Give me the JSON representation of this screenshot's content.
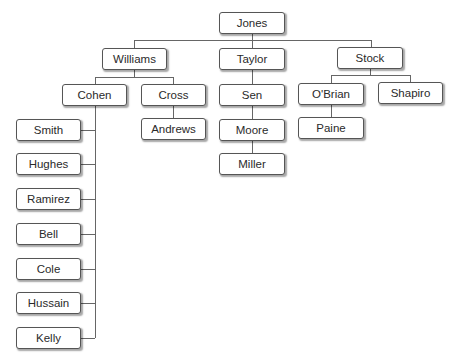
{
  "diagram": {
    "type": "org-chart",
    "nodes": {
      "jones": {
        "label": "Jones",
        "x": 219,
        "y": 12,
        "w": 66,
        "h": 22
      },
      "williams": {
        "label": "Williams",
        "x": 102,
        "y": 48,
        "w": 65,
        "h": 22
      },
      "taylor": {
        "label": "Taylor",
        "x": 219,
        "y": 48,
        "w": 66,
        "h": 22
      },
      "stock": {
        "label": "Stock",
        "x": 337,
        "y": 47,
        "w": 66,
        "h": 22
      },
      "cohen": {
        "label": "Cohen",
        "x": 62,
        "y": 84,
        "w": 65,
        "h": 22
      },
      "cross": {
        "label": "Cross",
        "x": 141,
        "y": 84,
        "w": 65,
        "h": 22
      },
      "sen": {
        "label": "Sen",
        "x": 219,
        "y": 84,
        "w": 66,
        "h": 22
      },
      "obrian": {
        "label": "O'Brian",
        "x": 298,
        "y": 83,
        "w": 66,
        "h": 22
      },
      "shapiro": {
        "label": "Shapiro",
        "x": 378,
        "y": 82,
        "w": 65,
        "h": 22
      },
      "andrews": {
        "label": "Andrews",
        "x": 141,
        "y": 118,
        "w": 65,
        "h": 22
      },
      "moore": {
        "label": "Moore",
        "x": 219,
        "y": 119,
        "w": 66,
        "h": 22
      },
      "paine": {
        "label": "Paine",
        "x": 298,
        "y": 117,
        "w": 66,
        "h": 22
      },
      "miller": {
        "label": "Miller",
        "x": 219,
        "y": 153,
        "w": 66,
        "h": 22
      },
      "smith": {
        "label": "Smith",
        "x": 16,
        "y": 119,
        "w": 65,
        "h": 22
      },
      "hughes": {
        "label": "Hughes",
        "x": 16,
        "y": 153,
        "w": 65,
        "h": 22
      },
      "ramirez": {
        "label": "Ramirez",
        "x": 16,
        "y": 188,
        "w": 65,
        "h": 22
      },
      "bell": {
        "label": "Bell",
        "x": 16,
        "y": 223,
        "w": 65,
        "h": 22
      },
      "cole": {
        "label": "Cole",
        "x": 16,
        "y": 258,
        "w": 65,
        "h": 22
      },
      "hussain": {
        "label": "Hussain",
        "x": 16,
        "y": 292,
        "w": 65,
        "h": 22
      },
      "kelly": {
        "label": "Kelly",
        "x": 16,
        "y": 327,
        "w": 65,
        "h": 22
      }
    },
    "hierarchy": {
      "Jones": [
        "Williams",
        "Taylor",
        "Stock"
      ],
      "Williams": [
        "Cohen",
        "Cross"
      ],
      "Cohen": [
        "Smith",
        "Hughes",
        "Ramirez",
        "Bell",
        "Cole",
        "Hussain",
        "Kelly"
      ],
      "Cross": [
        "Andrews"
      ],
      "Taylor": [
        "Sen"
      ],
      "Sen": [
        "Moore"
      ],
      "Moore": [
        "Miller"
      ],
      "Stock": [
        "O'Brian",
        "Shapiro"
      ],
      "O'Brian": [
        "Paine"
      ]
    },
    "colors": {
      "line": "#666666",
      "border": "#555555",
      "fill": "#ffffff",
      "text": "#2a2a2a"
    }
  }
}
